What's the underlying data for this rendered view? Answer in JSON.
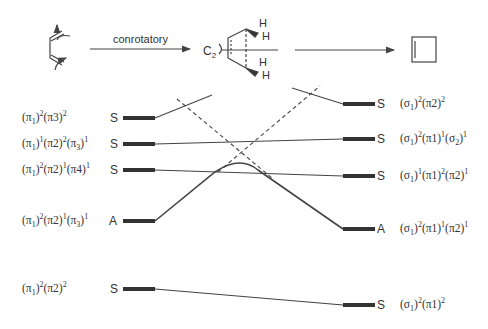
{
  "header": {
    "arrow_label": "conrotatory",
    "axis_label": "C",
    "axis_sub": "2",
    "hydrogen": "H"
  },
  "left_states": [
    {
      "config": "(π1)2(π3)2",
      "symmetry": "S",
      "y": 118
    },
    {
      "config": "(π1)1(π2)2(π3)1",
      "symmetry": "S",
      "y": 144
    },
    {
      "config": "(π1)2(π2)1(π4)1",
      "symmetry": "S",
      "y": 170
    },
    {
      "config": "(π1)2(π2)1(π3)1",
      "symmetry": "A",
      "y": 221
    },
    {
      "config": "(π1)2(π2)2",
      "symmetry": "S",
      "y": 289
    }
  ],
  "right_states": [
    {
      "config": "(σ1)2(π2)2",
      "symmetry": "S",
      "y": 104
    },
    {
      "config": "(σ1)2(π1)1(σ2)1",
      "symmetry": "S",
      "y": 139
    },
    {
      "config": "(σ1)1(π1)2(π2)1",
      "symmetry": "S",
      "y": 176
    },
    {
      "config": "(σ1)2(π1)1(π2)1",
      "symmetry": "A",
      "y": 229
    },
    {
      "config": "(σ1)2(π1)2",
      "symmetry": "S",
      "y": 305
    }
  ],
  "colors": {
    "line": "#444444",
    "bar": "#333333"
  }
}
